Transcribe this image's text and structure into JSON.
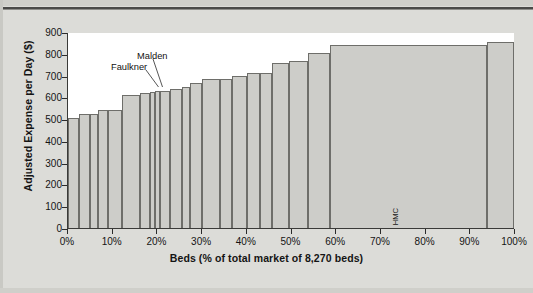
{
  "chart_data": {
    "type": "bar",
    "title": "",
    "subtitle": "",
    "xlabel": "Beds (% of total market of 8,270 beds)",
    "ylabel": "Adjusted Expense per Day ($)",
    "ylim": [
      0,
      900
    ],
    "xlim": [
      0,
      100
    ],
    "y_ticks": [
      900,
      800,
      700,
      600,
      500,
      400,
      300,
      200,
      100,
      0
    ],
    "x_ticks": [
      "0%",
      "10%",
      "20%",
      "30%",
      "40%",
      "50%",
      "60%",
      "70%",
      "80%",
      "90%",
      "100%"
    ],
    "x_tick_values": [
      0,
      10,
      20,
      30,
      40,
      50,
      60,
      70,
      80,
      90,
      100
    ],
    "grid": false,
    "legend": null,
    "note": "Variable-width (marimekko) bar chart: bar width = share of 8,270 total market beds, bar height = adjusted expense per day in dollars. Bars sorted ascending by expense.",
    "units": {
      "x": "percent of total market beds",
      "y": "dollars per day"
    },
    "total_beds": "8,270",
    "categories": [
      "Winchester",
      "AtlantiCare",
      "Beverly",
      "Lowell",
      "St. Johns",
      "South Shore",
      "Goddard",
      "Faulkner",
      "Malden",
      "Leonard Morse",
      "NNE Memorial",
      "Waltham",
      "Lahey",
      "Lawrence",
      "Norwood",
      "Salem",
      "St. Elizabeth's",
      "Mount Auburn",
      "Newton-Wellesley",
      "NE Medical Center",
      "Framingham",
      "HMC",
      "University"
    ],
    "values": [
      510,
      525,
      525,
      545,
      545,
      615,
      625,
      630,
      632,
      632,
      643,
      650,
      667,
      687,
      686,
      702,
      714,
      716,
      762,
      773,
      808,
      843,
      858
    ],
    "widths_pct": [
      1.9,
      2.0,
      1.6,
      1.7,
      2.5,
      3.4,
      1.8,
      0.9,
      0.9,
      1.7,
      2.2,
      1.5,
      2.1,
      3.3,
      2.2,
      2.6,
      2.4,
      2.1,
      3.1,
      3.5,
      3.9,
      28.5,
      4.8
    ],
    "series": [
      {
        "name": "Adjusted Expense per Day ($)",
        "points": [
          {
            "label": "Winchester",
            "value": 510,
            "width_pct": 1.9
          },
          {
            "label": "AtlantiCare",
            "value": 525,
            "width_pct": 2.0
          },
          {
            "label": "Beverly",
            "value": 525,
            "width_pct": 1.6
          },
          {
            "label": "Lowell",
            "value": 545,
            "width_pct": 1.7
          },
          {
            "label": "St. Johns",
            "value": 545,
            "width_pct": 2.5
          },
          {
            "label": "South Shore",
            "value": 615,
            "width_pct": 3.4
          },
          {
            "label": "Goddard",
            "value": 625,
            "width_pct": 1.8
          },
          {
            "label": "Faulkner",
            "value": 630,
            "width_pct": 0.9
          },
          {
            "label": "Malden",
            "value": 632,
            "width_pct": 0.9
          },
          {
            "label": "Leonard Morse",
            "value": 632,
            "width_pct": 1.7
          },
          {
            "label": "NNE Memorial",
            "value": 643,
            "width_pct": 2.2
          },
          {
            "label": "Waltham",
            "value": 650,
            "width_pct": 1.5
          },
          {
            "label": "Lahey",
            "value": 667,
            "width_pct": 2.1
          },
          {
            "label": "Lawrence",
            "value": 687,
            "width_pct": 3.3
          },
          {
            "label": "Norwood",
            "value": 686,
            "width_pct": 2.2
          },
          {
            "label": "Salem",
            "value": 702,
            "width_pct": 2.6
          },
          {
            "label": "St. Elizabeth's",
            "value": 714,
            "width_pct": 2.4
          },
          {
            "label": "Mount Auburn",
            "value": 716,
            "width_pct": 2.1
          },
          {
            "label": "Newton-Wellesley",
            "value": 762,
            "width_pct": 3.1
          },
          {
            "label": "NE Medical Center",
            "value": 773,
            "width_pct": 3.5
          },
          {
            "label": "Framingham",
            "value": 808,
            "width_pct": 3.9
          },
          {
            "label": "HMC",
            "value": 843,
            "width_pct": 28.5
          },
          {
            "label": "University",
            "value": 858,
            "width_pct": 4.8
          }
        ]
      }
    ],
    "annotations": [
      {
        "text": "Faulkner",
        "target_category": "Faulkner"
      },
      {
        "text": "Malden",
        "target_category": "Malden"
      }
    ]
  },
  "colors": {
    "bar_fill": "#cdcdc9",
    "bar_stroke": "#6e6e6a",
    "axis": "#3a3a38",
    "text": "#141414",
    "page_background": "#dcdcd8",
    "plot_background": "#ffffff"
  }
}
